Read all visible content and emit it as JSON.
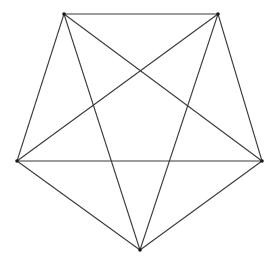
{
  "diagram": {
    "type": "complete-graph",
    "name": "K5",
    "colors": {
      "edge": "#3a3a3a",
      "vertex": "#1a1a1a",
      "background": "#ffffff"
    },
    "vertices": [
      {
        "id": "A",
        "x": 64,
        "y": 14
      },
      {
        "id": "B",
        "x": 218,
        "y": 14
      },
      {
        "id": "C",
        "x": 262,
        "y": 161
      },
      {
        "id": "D",
        "x": 140,
        "y": 250
      },
      {
        "id": "E",
        "x": 17,
        "y": 161
      }
    ],
    "edges": [
      [
        "A",
        "B"
      ],
      [
        "B",
        "C"
      ],
      [
        "C",
        "D"
      ],
      [
        "D",
        "E"
      ],
      [
        "E",
        "A"
      ],
      [
        "A",
        "C"
      ],
      [
        "A",
        "D"
      ],
      [
        "B",
        "D"
      ],
      [
        "B",
        "E"
      ],
      [
        "C",
        "E"
      ]
    ]
  }
}
